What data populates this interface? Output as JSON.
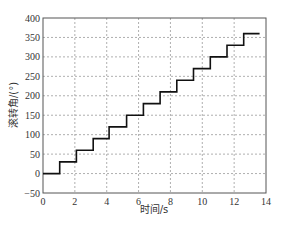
{
  "chart_data": {
    "type": "line",
    "title": "",
    "xlabel": "时间/s",
    "ylabel": "滚转角/(°)",
    "xlim": [
      0,
      14
    ],
    "ylim": [
      -50,
      400
    ],
    "xticks": [
      0,
      2,
      4,
      6,
      8,
      10,
      12,
      14
    ],
    "yticks": [
      -50,
      0,
      50,
      100,
      150,
      200,
      250,
      300,
      350,
      400
    ],
    "grid": true,
    "legend": null,
    "series": [
      {
        "name": "滚转角",
        "color": "#111111",
        "step_times": [
          1.05,
          2.1,
          3.15,
          4.15,
          5.25,
          6.3,
          7.35,
          8.4,
          9.45,
          10.5,
          11.55,
          12.6
        ],
        "levels": [
          0,
          30,
          60,
          90,
          120,
          150,
          180,
          210,
          240,
          270,
          300,
          330,
          360
        ],
        "t_end": 13.6,
        "x": [
          0,
          1.05,
          1.05,
          2.1,
          2.1,
          3.15,
          3.15,
          4.15,
          4.15,
          5.25,
          5.25,
          6.3,
          6.3,
          7.35,
          7.35,
          8.4,
          8.4,
          9.45,
          9.45,
          10.5,
          10.5,
          11.55,
          11.55,
          12.6,
          12.6,
          13.6
        ],
        "y": [
          0,
          0,
          30,
          30,
          60,
          60,
          90,
          90,
          120,
          120,
          150,
          150,
          180,
          180,
          210,
          210,
          240,
          240,
          270,
          270,
          300,
          300,
          330,
          330,
          360,
          360
        ]
      }
    ]
  },
  "colors": {
    "line": "#111111",
    "grid": "#9a9a9a",
    "axis": "#555555"
  }
}
